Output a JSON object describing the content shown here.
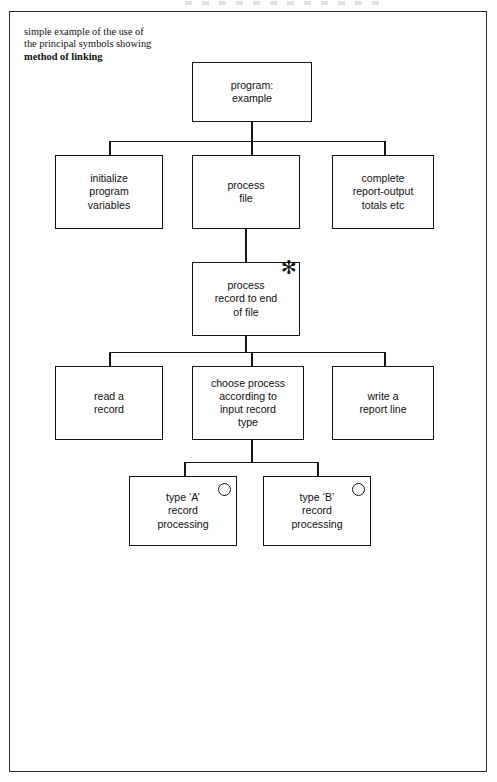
{
  "caption": {
    "line1": "simple example of the use of",
    "line2": "the principal symbols showing",
    "line3_bold": "method of linking"
  },
  "diagram": {
    "type": "structure-chart",
    "nodes": [
      {
        "id": "root",
        "text": "program:\nexample",
        "level": 0,
        "marker": "none"
      },
      {
        "id": "initialize",
        "text": "initialize\nprogram\nvariables",
        "level": 1,
        "marker": "none"
      },
      {
        "id": "process-file",
        "text": "process\nfile",
        "level": 1,
        "marker": "none"
      },
      {
        "id": "complete",
        "text": "complete\nreport-output\ntotals etc",
        "level": 1,
        "marker": "none"
      },
      {
        "id": "process-record",
        "text": "process\nrecord to end\nof file",
        "level": 2,
        "marker": "iteration"
      },
      {
        "id": "read-record",
        "text": "read a\nrecord",
        "level": 3,
        "marker": "none"
      },
      {
        "id": "choose-process",
        "text": "choose process\naccording to\ninput record\ntype",
        "level": 3,
        "marker": "none"
      },
      {
        "id": "write-line",
        "text": "write a\nreport line",
        "level": 3,
        "marker": "none"
      },
      {
        "id": "type-a",
        "text": "type ‘A’\nrecord\nprocessing",
        "level": 4,
        "marker": "selection"
      },
      {
        "id": "type-b",
        "text": "type ‘B’\nrecord\nprocessing",
        "level": 4,
        "marker": "selection"
      }
    ],
    "edges": [
      {
        "from": "root",
        "to": "initialize"
      },
      {
        "from": "root",
        "to": "process-file"
      },
      {
        "from": "root",
        "to": "complete"
      },
      {
        "from": "process-file",
        "to": "process-record"
      },
      {
        "from": "process-record",
        "to": "read-record"
      },
      {
        "from": "process-record",
        "to": "choose-process"
      },
      {
        "from": "process-record",
        "to": "write-line"
      },
      {
        "from": "choose-process",
        "to": "type-a"
      },
      {
        "from": "choose-process",
        "to": "type-b"
      }
    ],
    "markers": {
      "iteration_glyph": "✻",
      "selection_glyph": "○"
    },
    "colors": {
      "line": "#141414",
      "text": "#101010",
      "background": "#ffffff",
      "frame": "#2a2a2a"
    }
  }
}
